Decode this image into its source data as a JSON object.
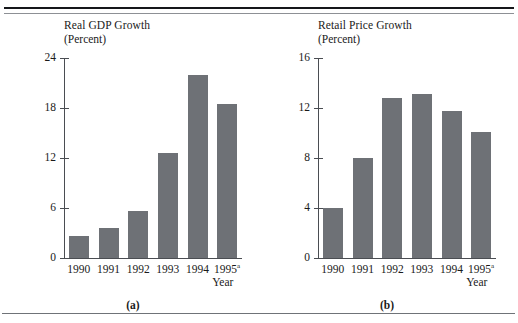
{
  "figure": {
    "panel_a_letter": "(a)",
    "panel_b_letter": "(b)"
  },
  "chart_data": [
    {
      "type": "bar",
      "panel": "(a)",
      "title": "Real GDP Growth",
      "subtitle": "(Percent)",
      "xlabel": "Year",
      "ylabel": "",
      "categories": [
        "1990",
        "1991",
        "1992",
        "1993",
        "1994",
        "1995"
      ],
      "category_notes": [
        "",
        "",
        "",
        "",
        "",
        "a"
      ],
      "values": [
        2.6,
        3.6,
        5.6,
        12.6,
        22.0,
        18.5
      ],
      "yticks": [
        0,
        6,
        12,
        18,
        24
      ],
      "ytick_labels": [
        "0",
        "6",
        "12",
        "18",
        "24"
      ],
      "ylim": [
        0,
        24
      ],
      "grid": false,
      "legend": "none",
      "bar_color": "#6e7176"
    },
    {
      "type": "bar",
      "panel": "(b)",
      "title": "Retail Price Growth",
      "subtitle": "(Percent)",
      "xlabel": "Year",
      "ylabel": "",
      "categories": [
        "1990",
        "1991",
        "1992",
        "1993",
        "1994",
        "1995"
      ],
      "category_notes": [
        "",
        "",
        "",
        "",
        "",
        "a"
      ],
      "values": [
        4.0,
        8.0,
        12.8,
        13.1,
        11.8,
        10.1
      ],
      "yticks": [
        0,
        4,
        8,
        12,
        16
      ],
      "ytick_labels": [
        "0",
        "4",
        "8",
        "12",
        "16"
      ],
      "ylim": [
        0,
        16
      ],
      "grid": false,
      "legend": "none",
      "bar_color": "#6e7176"
    }
  ]
}
